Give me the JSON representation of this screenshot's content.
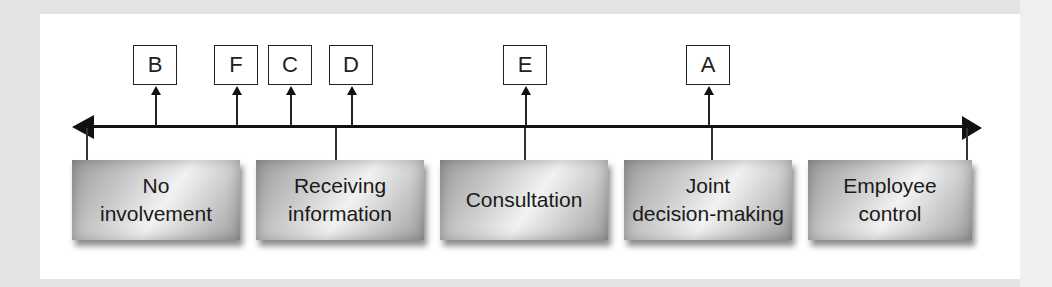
{
  "diagram": {
    "type": "continuum",
    "axis": {
      "direction": "bidirectional"
    },
    "categories": [
      {
        "label": "No\ninvolvement"
      },
      {
        "label": "Receiving\ninformation"
      },
      {
        "label": "Consultation"
      },
      {
        "label": "Joint\ndecision-making"
      },
      {
        "label": "Employee\ncontrol"
      }
    ],
    "markers": [
      {
        "label": "B"
      },
      {
        "label": "F"
      },
      {
        "label": "C"
      },
      {
        "label": "D"
      },
      {
        "label": "E"
      },
      {
        "label": "A"
      }
    ],
    "colors": {
      "background": "#e4e4e4",
      "panel": "#ffffff",
      "line": "#111111"
    }
  }
}
